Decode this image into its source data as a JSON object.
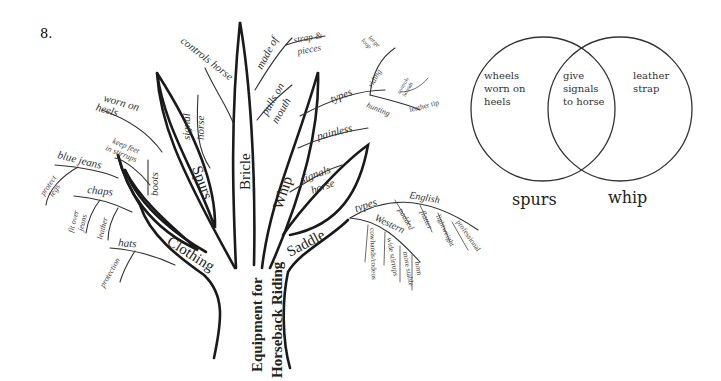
{
  "item_number": "8.",
  "tree": {
    "root": {
      "line1": "Equipment for",
      "line2": "Horseback Riding"
    },
    "branches": {
      "clothing": {
        "label": "Clothing",
        "details": {
          "worn_on_heels": {
            "line1": "worn on",
            "line2": "heels"
          },
          "keep_feet": {
            "line1": "keep feet",
            "line2": "in stirrups"
          },
          "boots": "boots",
          "blue_jeans": "blue jeans",
          "protect_legs": {
            "line1": "protect",
            "line2": "legs"
          },
          "chaps": "chaps",
          "fit_over_jeans": {
            "line1": "fit over",
            "line2": "jeans"
          },
          "leather": "leather",
          "hats": "hats",
          "protection": "protection"
        }
      },
      "spurs": {
        "label": "Spurs",
        "details": {
          "signal_horse": {
            "line1": "signal",
            "line2": "horse"
          }
        }
      },
      "bridle": {
        "label": "Bricle",
        "details": {
          "controls_horse": "controls horse",
          "made_of": "made of",
          "strap_pieces": {
            "line1": "strap &",
            "line2": "pieces"
          },
          "pulls_on_mouth": {
            "line1": "pulls on",
            "line2": "mouth"
          }
        }
      },
      "whip": {
        "label": "Whip",
        "details": {
          "types": "types",
          "riding": "riding",
          "large_loop": {
            "line1": "large",
            "line2": "loop"
          },
          "hunting": "hunting",
          "controls_hounds": {
            "line1": "controls",
            "line2": "hounds"
          },
          "leather_tip": "leather tip",
          "painless": "painless",
          "signals_horse": {
            "line1": "signals",
            "line2": "horse"
          }
        }
      },
      "saddle": {
        "label": "Saddle",
        "details": {
          "types": "types",
          "english": "English",
          "padded": "padded",
          "flatter": "flatter",
          "lightweight": "lightweight",
          "professional": "professional",
          "western": "Western",
          "cowhands_rodeos": "cowhands/rodeos",
          "wide_stirrups": "wide stirrups",
          "more_stable": "more stable",
          "horn": "horn"
        }
      }
    }
  },
  "venn": {
    "left_label": "spurs",
    "right_label": "whip",
    "left_only": {
      "line1": "wheels",
      "line2": "worn on",
      "line3": "heels"
    },
    "overlap": {
      "line1": "give",
      "line2": "signals",
      "line3": "to horse"
    },
    "right_only": {
      "line1": "leather",
      "line2": "strap"
    }
  }
}
